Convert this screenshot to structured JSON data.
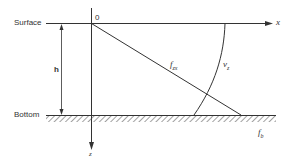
{
  "diagram": {
    "labels": {
      "surface": "Surface",
      "bottom": "Bottom",
      "h": "h",
      "origin": "0",
      "x_axis": "x",
      "z_axis": "z",
      "f_zx": "f",
      "f_zx_sub": "zx",
      "v_z": "v",
      "v_z_sub": "z",
      "f_b": "f",
      "f_b_sub": "b"
    },
    "colors": {
      "line": "#333333",
      "background": "#ffffff"
    }
  }
}
